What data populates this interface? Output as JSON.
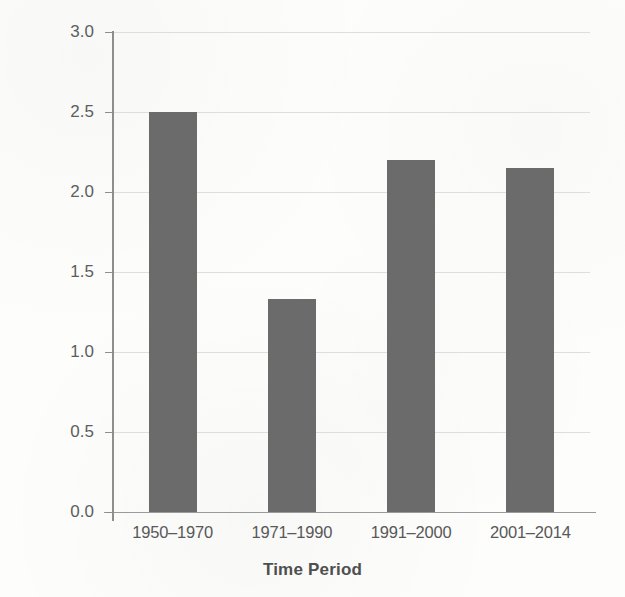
{
  "chart_data": {
    "type": "bar",
    "title": "",
    "xlabel": "Time Period",
    "ylabel": "Productivity Growth (%)",
    "categories": [
      "1950–1970",
      "1971–1990",
      "1991–2000",
      "2001–2014"
    ],
    "values": [
      2.5,
      1.33,
      2.2,
      2.15
    ],
    "ylim": [
      0.0,
      3.0
    ],
    "ytick_labels": [
      "0.0",
      "0.5",
      "1.0",
      "1.5",
      "2.0",
      "2.5",
      "3.0"
    ],
    "ytick_values": [
      0.0,
      0.5,
      1.0,
      1.5,
      2.0,
      2.5,
      3.0
    ],
    "grid": "horizontal",
    "legend": "none",
    "bar_color": "#6b6b6b",
    "grid_color": "#dedede",
    "axis_color": "#8e8e8e",
    "background_color": "#fdfdfc"
  }
}
